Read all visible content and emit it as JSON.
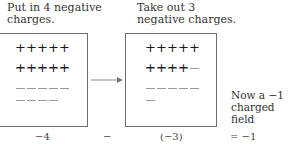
{
  "left_panel": {
    "caption_lines": [
      "Put in 4 negative",
      "charges."
    ],
    "rows": [
      {
        "type": "plus",
        "count": 5
      },
      {
        "type": "minus",
        "count": 5
      },
      {
        "type": "plus",
        "count": 5
      },
      {
        "type": "minus",
        "count": 5
      },
      {
        "type": "minus",
        "count": 4
      }
    ]
  },
  "right_panel": {
    "caption_lines": [
      "Take out 3",
      "negative charges."
    ],
    "rows": [
      {
        "type": "plus",
        "count": 5
      },
      {
        "type": "minus",
        "count": 5
      },
      {
        "type": "plus",
        "count": 4
      },
      {
        "type": "minus",
        "count": 5
      },
      {
        "type": "minus",
        "count": 1
      }
    ]
  },
  "result_note": [
    "Now a −1",
    "charged field"
  ],
  "equation": {
    "term1": "−4",
    "operator": "−",
    "term2": "(−3)",
    "result": "= −1"
  },
  "colors": {
    "border": "#6e6e6e",
    "plus": "#1c1c1c",
    "minus": "#9a9a9a",
    "arrow": "#888888"
  }
}
